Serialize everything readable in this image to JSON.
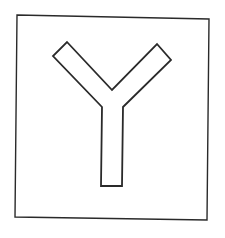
{
  "figure": {
    "glyph": "Y",
    "stroke_color": "#2a2a2a",
    "background_color": "#ffffff",
    "frame": {
      "points": "17,15 209,19 207,220 15,217",
      "stroke_width": 1.4
    },
    "y_shape": {
      "points": "67,42 112,90 157,44 171,60 123,107 122,186 101,186 102,107 53,56",
      "stroke_width": 1.8
    }
  }
}
